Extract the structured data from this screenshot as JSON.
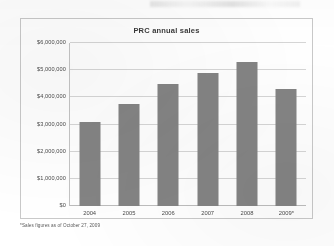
{
  "chart_data": {
    "type": "bar",
    "title": "PRC annual sales",
    "categories": [
      "2004",
      "2005",
      "2006",
      "2007",
      "2008",
      "2009*"
    ],
    "values": [
      3100000,
      3750000,
      4500000,
      4900000,
      5300000,
      4300000
    ],
    "xlabel": "",
    "ylabel": "",
    "ylim": [
      0,
      6000000
    ],
    "ytick_labels": [
      "$6,000,000",
      "$5,000,000",
      "$4,000,000",
      "$3,000,000",
      "$2,000,000",
      "$1,000,000",
      "$0"
    ],
    "ytick_values": [
      6000000,
      5000000,
      4000000,
      3000000,
      2000000,
      1000000,
      0
    ],
    "grid": true,
    "legend": null,
    "series_color": "#848484",
    "annotations": [
      "*Sales figures as of October 27, 2009"
    ]
  },
  "footnote": "*Sales figures as of October 27, 2009"
}
